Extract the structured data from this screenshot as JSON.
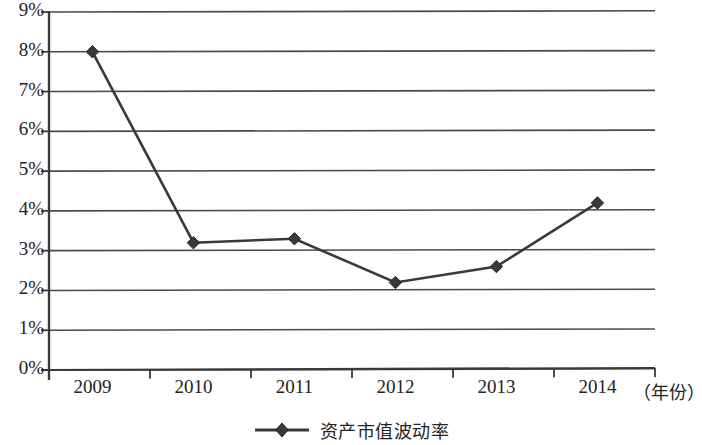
{
  "chart_data": {
    "type": "line",
    "title": "",
    "subtitle": "",
    "xlabel": "（年份）",
    "ylabel": "",
    "categories": [
      "2009",
      "2010",
      "2011",
      "2012",
      "2013",
      "2014"
    ],
    "series": [
      {
        "name": "资产市值波动率",
        "values": [
          8.0,
          3.2,
          3.3,
          2.2,
          2.6,
          4.2
        ],
        "marker": "diamond",
        "color": "#3a3a3a"
      }
    ],
    "ylim": [
      0,
      9
    ],
    "ytick_values": [
      0,
      1,
      2,
      3,
      4,
      5,
      6,
      7,
      8,
      9
    ],
    "ytick_labels": [
      "0%",
      "1%",
      "2%",
      "3%",
      "4%",
      "5%",
      "6%",
      "7%",
      "8%",
      "9%"
    ],
    "grid": true,
    "grid_axis": "y",
    "legend_position": "bottom",
    "legend_entries": [
      "资产市值波动率"
    ],
    "units": "percent"
  },
  "axes": {
    "x_unit_note": "（年份）"
  },
  "legend": {
    "entry_label": "资产市值波动率"
  },
  "style": {
    "line_color": "#3a3a3a",
    "grid_color": "#4a4a4a",
    "axis_color": "#3a3a3a",
    "text_color": "#232323",
    "background": "#ffffff"
  }
}
